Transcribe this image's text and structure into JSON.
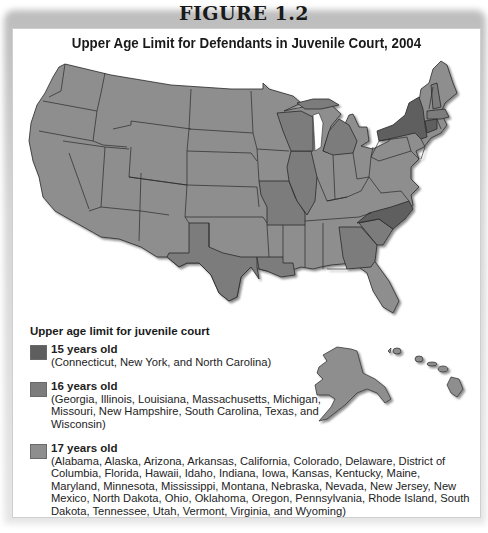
{
  "figure_label": "FIGURE 1.2",
  "title": "Upper Age Limit for Defendants in Juvenile Court, 2004",
  "colors": {
    "age_15": "#5e5e5e",
    "age_16": "#7c7c7c",
    "age_17": "#8e8e8e",
    "border": "#2a2a2a",
    "lake": "#ffffff"
  },
  "legend": {
    "heading": "Upper age limit for juvenile court",
    "items": [
      {
        "label": "15 years old",
        "states": "(Connecticut, New York, and North Carolina)",
        "color": "#5e5e5e"
      },
      {
        "label": "16 years old",
        "states": "(Georgia, Illinois, Louisiana, Massachusetts, Michigan, Missouri, New Hampshire, South Carolina, Texas, and Wisconsin)",
        "color": "#7c7c7c"
      },
      {
        "label": "17 years old",
        "states": "(Alabama, Alaska, Arizona, Arkansas, California, Colorado, Delaware, District of Columbia, Florida, Hawaii, Idaho, Indiana, Iowa, Kansas, Kentucky, Maine, Maryland, Minnesota, Mississippi, Montana, Nebraska, Nevada, New Jersey, New Mexico, North Dakota, Ohio, Oklahoma, Oregon, Pennsylvania, Rhode Island, South Dakota, Tennessee, Utah, Vermont, Virginia, and Wyoming)",
        "color": "#8e8e8e"
      }
    ]
  },
  "map_regions": {
    "age_15": [
      "Connecticut",
      "New York",
      "North Carolina"
    ],
    "age_16": [
      "Georgia",
      "Illinois",
      "Louisiana",
      "Massachusetts",
      "Michigan",
      "Missouri",
      "New Hampshire",
      "South Carolina",
      "Texas",
      "Wisconsin"
    ],
    "age_17": [
      "Alabama",
      "Alaska",
      "Arizona",
      "Arkansas",
      "California",
      "Colorado",
      "Delaware",
      "District of Columbia",
      "Florida",
      "Hawaii",
      "Idaho",
      "Indiana",
      "Iowa",
      "Kansas",
      "Kentucky",
      "Maine",
      "Maryland",
      "Minnesota",
      "Mississippi",
      "Montana",
      "Nebraska",
      "Nevada",
      "New Jersey",
      "New Mexico",
      "North Dakota",
      "Ohio",
      "Oklahoma",
      "Oregon",
      "Pennsylvania",
      "Rhode Island",
      "South Dakota",
      "Tennessee",
      "Utah",
      "Vermont",
      "Virginia",
      "Wyoming"
    ]
  }
}
